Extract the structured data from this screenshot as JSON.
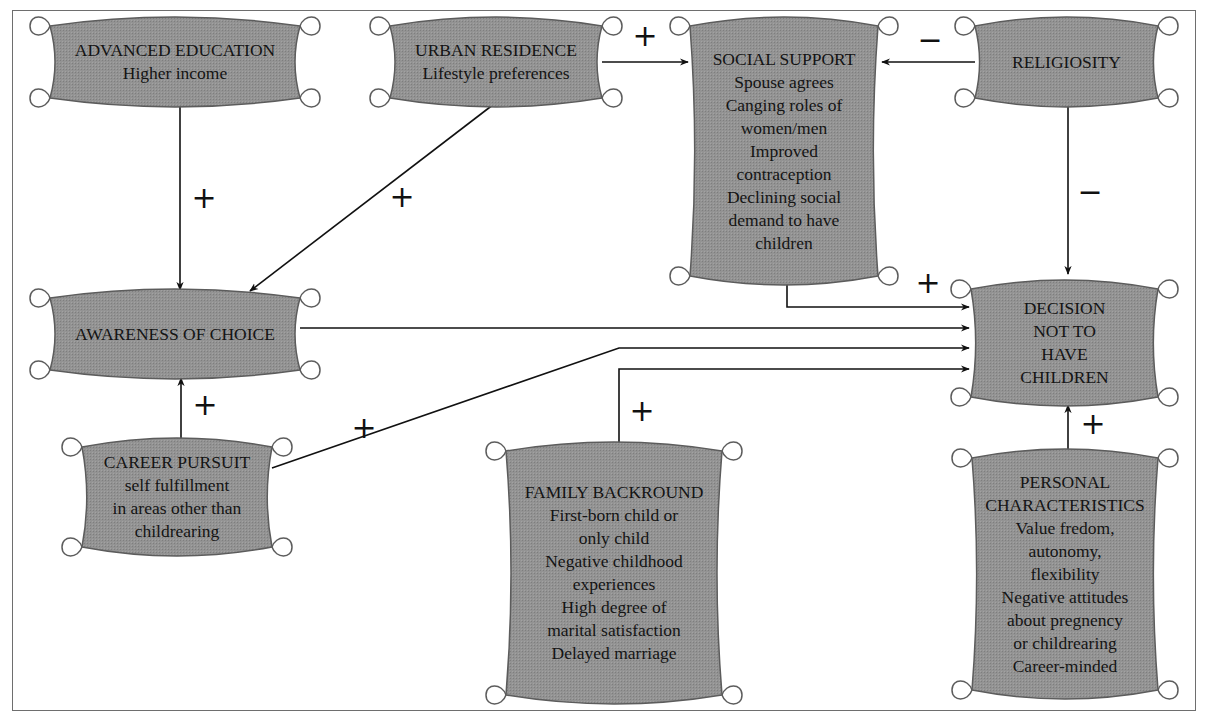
{
  "diagram": {
    "fill_color": "#8f8f8f",
    "stroke_color": "#5c5c5c",
    "nodes": [
      {
        "id": "advanced_education",
        "x": 50,
        "y": 20,
        "w": 250,
        "h": 84,
        "lines": [
          "ADVANCED EDUCATION",
          "Higher income"
        ]
      },
      {
        "id": "urban_residence",
        "x": 390,
        "y": 20,
        "w": 212,
        "h": 84,
        "lines": [
          "URBAN RESIDENCE",
          "Lifestyle preferences"
        ]
      },
      {
        "id": "social_support",
        "x": 690,
        "y": 20,
        "w": 188,
        "h": 262,
        "lines": [
          "SOCIAL SUPPORT",
          "Spouse agrees",
          "Canging roles of",
          "women/men",
          "Improved",
          "contraception",
          "Declining social",
          "demand to have",
          "children"
        ]
      },
      {
        "id": "religiosity",
        "x": 975,
        "y": 20,
        "w": 183,
        "h": 84,
        "lines": [
          "RELIGIOSITY"
        ]
      },
      {
        "id": "awareness_of_choice",
        "x": 50,
        "y": 292,
        "w": 250,
        "h": 84,
        "lines": [
          "AWARENESS OF CHOICE"
        ]
      },
      {
        "id": "decision",
        "x": 971,
        "y": 283,
        "w": 187,
        "h": 120,
        "lines": [
          "DECISION",
          "NOT TO",
          "HAVE",
          "CHILDREN"
        ]
      },
      {
        "id": "career_pursuit",
        "x": 82,
        "y": 441,
        "w": 190,
        "h": 112,
        "lines": [
          "CAREER PURSUIT",
          "self fulfillment",
          "in areas other than",
          "childrearing"
        ]
      },
      {
        "id": "family_background",
        "x": 506,
        "y": 445,
        "w": 216,
        "h": 256,
        "lines": [
          "FAMILY BACKROUND",
          "First-born child or",
          "only child",
          "Negative childhood",
          "experiences",
          "High degree of",
          "marital satisfaction",
          "Delayed marriage"
        ]
      },
      {
        "id": "personal_characteristics",
        "x": 972,
        "y": 452,
        "w": 186,
        "h": 244,
        "lines": [
          "PERSONAL",
          "CHARACTERISTICS",
          "Value fredom,",
          "autonomy,",
          "flexibility",
          "Negative attitudes",
          "about pregnency",
          "or childrearing",
          "Career-minded"
        ]
      }
    ],
    "edges": [
      {
        "id": "advanced_to_awareness",
        "points": [
          [
            180,
            104
          ],
          [
            180,
            290
          ]
        ],
        "arrow": true
      },
      {
        "id": "urban_to_awareness",
        "points": [
          [
            494,
            104
          ],
          [
            250,
            291
          ]
        ],
        "arrow": true
      },
      {
        "id": "urban_to_social",
        "points": [
          [
            602,
            62
          ],
          [
            688,
            62
          ]
        ],
        "arrow": true
      },
      {
        "id": "religiosity_to_social",
        "points": [
          [
            975,
            62
          ],
          [
            882,
            62
          ]
        ],
        "arrow": true
      },
      {
        "id": "religiosity_to_decision",
        "points": [
          [
            1068,
            104
          ],
          [
            1068,
            274
          ]
        ],
        "arrow": true
      },
      {
        "id": "social_to_decision",
        "points": [
          [
            787,
            282
          ],
          [
            787,
            307
          ],
          [
            969,
            307
          ]
        ],
        "arrow": true
      },
      {
        "id": "awareness_to_decision",
        "points": [
          [
            300,
            328
          ],
          [
            969,
            328
          ]
        ],
        "arrow": true
      },
      {
        "id": "career_to_decision",
        "points": [
          [
            272,
            468
          ],
          [
            619,
            348
          ],
          [
            969,
            348
          ]
        ],
        "arrow": true
      },
      {
        "id": "family_to_decision",
        "points": [
          [
            619,
            445
          ],
          [
            619,
            369
          ],
          [
            969,
            369
          ]
        ],
        "arrow": true
      },
      {
        "id": "career_to_awareness",
        "points": [
          [
            181,
            441
          ],
          [
            181,
            378
          ]
        ],
        "arrow": true
      },
      {
        "id": "personal_to_decision",
        "points": [
          [
            1068,
            452
          ],
          [
            1068,
            405
          ]
        ],
        "arrow": true
      }
    ],
    "signs": [
      {
        "id": "sign_advanced_awareness",
        "x": 204,
        "y": 198,
        "text": "+"
      },
      {
        "id": "sign_urban_awareness",
        "x": 402,
        "y": 197,
        "text": "+"
      },
      {
        "id": "sign_urban_social",
        "x": 645,
        "y": 36,
        "text": "+"
      },
      {
        "id": "sign_religiosity_social",
        "x": 930,
        "y": 40,
        "text": "−"
      },
      {
        "id": "sign_religiosity_decision",
        "x": 1090,
        "y": 192,
        "text": "−"
      },
      {
        "id": "sign_social_decision",
        "x": 928,
        "y": 283,
        "text": "+"
      },
      {
        "id": "sign_career_awareness",
        "x": 205,
        "y": 405,
        "text": "+"
      },
      {
        "id": "sign_career_decision",
        "x": 364,
        "y": 428,
        "text": "+"
      },
      {
        "id": "sign_family_decision",
        "x": 642,
        "y": 411,
        "text": "+"
      },
      {
        "id": "sign_personal_decision",
        "x": 1093,
        "y": 424,
        "text": "+"
      }
    ]
  }
}
